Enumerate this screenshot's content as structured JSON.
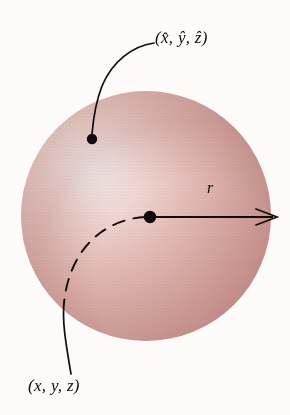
{
  "figure": {
    "kind": "geometry-diagram",
    "background_color": "#fdfcfb"
  },
  "sphere": {
    "center_x": 146,
    "center_y": 216,
    "radius": 125,
    "highlight_x": 80,
    "highlight_y": 170,
    "highlight_color": "#fdf7f5",
    "midtone_color": "#e3b6b1",
    "shadow_color": "#c08a86",
    "rim_color": "#bb8480",
    "texture": "halftone-dot-screen"
  },
  "points": [
    {
      "id": "surface-point",
      "label": "(x̂, ŷ, ẑ)",
      "x": 92,
      "y": 139,
      "dot_radius": 5.2
    },
    {
      "id": "center-point",
      "label": "(x, y, z)",
      "x": 150,
      "y": 217,
      "dot_radius": 6.2
    }
  ],
  "labels": {
    "hat_point": {
      "open_paren": "(",
      "terms": [
        "x̂",
        "ŷ",
        "ẑ"
      ],
      "separator": ", ",
      "close_paren": ")",
      "text": "(x̂, ŷ, ẑ)",
      "x": 155,
      "y": 29
    },
    "plain_point": {
      "open_paren": "(",
      "terms": [
        "x",
        "y",
        "z"
      ],
      "separator": ", ",
      "close_paren": ")",
      "text": "(x, y, z)",
      "x": 28,
      "y": 377
    },
    "radius": {
      "text": "r",
      "x": 207,
      "y": 180
    }
  },
  "radius_arrow": {
    "from_x": 150,
    "from_y": 217,
    "to_x": 277,
    "to_y": 217,
    "style": "solid",
    "arrowhead": "open-barb",
    "color": "#100d0c"
  },
  "leaders": [
    {
      "id": "hat-leader",
      "from": "hat_point_label",
      "to": "surface-point",
      "style": "solid-curve",
      "color": "#100d0c"
    },
    {
      "id": "plain-leader",
      "to": "center-point",
      "from": "plain_point_label",
      "style": "solid-outside-dashed-inside",
      "note": "dashed where hidden behind sphere surface",
      "color": "#100d0c"
    }
  ],
  "colors": {
    "ink": "#100d0c",
    "paper": "#fdfcfb",
    "rose_light": "#f6e1dd",
    "rose_mid": "#e3b6b1",
    "rose_dark": "#c08a86"
  }
}
